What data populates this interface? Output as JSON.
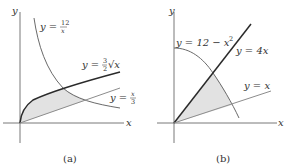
{
  "figure": {
    "panels": [
      {
        "id": "a",
        "caption": "(a)",
        "axis_labels": {
          "x": "x",
          "y": "y"
        },
        "curves": [
          {
            "name": "hyperbola",
            "label": "y = 12/x",
            "label_lhs": "y = ",
            "label_num": "12",
            "label_den": "x"
          },
          {
            "name": "root",
            "label": "y = (3/2)√x",
            "label_lhs": "y = ",
            "label_num": "3",
            "label_den": "2",
            "label_rad": "√x"
          },
          {
            "name": "line",
            "label": "y = x/3",
            "label_lhs": "y = ",
            "label_num": "x",
            "label_den": "3"
          }
        ],
        "shaded_region": "bounded by y=(3/2)√x, y=12/x, y=x/3"
      },
      {
        "id": "b",
        "caption": "(b)",
        "axis_labels": {
          "x": "x",
          "y": "y"
        },
        "curves": [
          {
            "name": "parabola",
            "label": "y = 12 − x²",
            "label_text": "y = 12 − x",
            "label_sup": "2"
          },
          {
            "name": "steep-line",
            "label": "y = 4x"
          },
          {
            "name": "diagonal-line",
            "label": "y = x"
          }
        ],
        "shaded_region": "bounded by y=4x, y=12−x², y=x"
      }
    ],
    "colors": {
      "axis": "#444444",
      "curve_dark": "#2a2a2a",
      "curve_medium": "#6a6a6a",
      "curve_light": "#8c8c8c",
      "shade": "#e2e2e2"
    }
  }
}
